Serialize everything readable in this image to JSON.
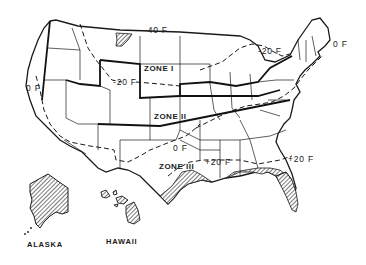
{
  "map": {
    "type": "US climate zone map",
    "zones": [
      {
        "id": "zone-1",
        "label": "ZONE I"
      },
      {
        "id": "zone-2",
        "label": "ZONE II"
      },
      {
        "id": "zone-3",
        "label": "ZONE III"
      }
    ],
    "isotherms": [
      {
        "id": "minus-40",
        "label": "-40 F"
      },
      {
        "id": "minus-20-west",
        "label": "-20 F"
      },
      {
        "id": "minus-20-east",
        "label": "-20 F"
      },
      {
        "id": "zero-west",
        "label": "0 F"
      },
      {
        "id": "zero-east",
        "label": "0 F"
      },
      {
        "id": "zero-south",
        "label": "0 F"
      },
      {
        "id": "plus-20-gulf",
        "label": "+20 F"
      },
      {
        "id": "plus-20-atlantic",
        "label": "+20 F"
      }
    ],
    "insets": [
      {
        "id": "alaska",
        "label": "ALASKA"
      },
      {
        "id": "hawaii",
        "label": "HAWAII"
      }
    ],
    "colors": {
      "line": "#1a1a1a",
      "background": "#ffffff",
      "hatch": "#333333"
    }
  }
}
